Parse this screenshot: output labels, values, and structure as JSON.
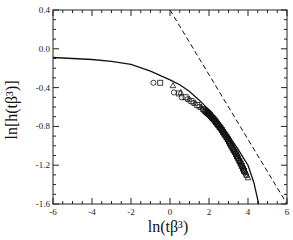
{
  "chart_data": {
    "type": "scatter",
    "title": "",
    "xlabel": "ln(tβ³)",
    "ylabel": "ln[h(tβ³)]",
    "xlim": [
      -6,
      6
    ],
    "ylim": [
      -1.6,
      0.4
    ],
    "x_ticks": [
      -6,
      -4,
      -2,
      0,
      2,
      4,
      6
    ],
    "x_tick_labels": [
      "-6",
      "-4",
      "-2",
      "0",
      "2",
      "4",
      "6"
    ],
    "y_ticks": [
      0.4,
      0.0,
      -0.4,
      -0.8,
      -1.2,
      -1.6
    ],
    "y_tick_labels": [
      "0.4",
      "0.0",
      "-0.4",
      "-0.8",
      "-1.2",
      "-1.6"
    ],
    "grid": false,
    "legend": null,
    "series": [
      {
        "name": "theory curve",
        "style": "solid-line",
        "x": [
          -6,
          -5,
          -4,
          -3,
          -2,
          -1,
          0,
          0.5,
          1,
          1.5,
          2,
          2.5,
          3,
          3.5,
          4,
          4.3,
          4.55
        ],
        "y": [
          -0.09,
          -0.1,
          -0.11,
          -0.13,
          -0.16,
          -0.23,
          -0.32,
          -0.37,
          -0.44,
          -0.53,
          -0.63,
          -0.75,
          -0.89,
          -1.04,
          -1.2,
          -1.38,
          -1.6
        ]
      },
      {
        "name": "asymptote slope -1/3",
        "style": "dashed-line",
        "x": [
          0,
          6
        ],
        "y": [
          0.4,
          -1.6
        ]
      },
      {
        "name": "data circles",
        "style": "circle-markers",
        "x": [
          -0.85,
          0.2,
          0.6,
          0.9,
          1.2,
          1.5,
          1.8,
          2.1,
          2.4,
          2.7,
          3.0,
          3.3,
          3.6,
          3.9
        ],
        "y": [
          -0.35,
          -0.45,
          -0.5,
          -0.52,
          -0.56,
          -0.6,
          -0.65,
          -0.7,
          -0.77,
          -0.85,
          -0.95,
          -1.06,
          -1.17,
          -1.3
        ]
      },
      {
        "name": "data squares",
        "style": "square-markers",
        "x": [
          -0.5,
          0.45,
          0.8,
          1.1,
          1.4,
          1.7,
          2.0,
          2.3,
          2.6,
          2.9,
          3.2,
          3.5,
          3.8
        ],
        "y": [
          -0.35,
          -0.46,
          -0.5,
          -0.54,
          -0.58,
          -0.62,
          -0.67,
          -0.74,
          -0.82,
          -0.91,
          -1.02,
          -1.13,
          -1.26
        ]
      },
      {
        "name": "data triangles",
        "style": "triangle-markers",
        "x": [
          0.15,
          0.55,
          1.0,
          1.3,
          1.6,
          1.9,
          2.2,
          2.5,
          2.8,
          3.1,
          3.4,
          3.7,
          4.0
        ],
        "y": [
          -0.38,
          -0.45,
          -0.52,
          -0.56,
          -0.6,
          -0.65,
          -0.71,
          -0.78,
          -0.87,
          -0.97,
          -1.08,
          -1.2,
          -1.33
        ]
      }
    ]
  }
}
